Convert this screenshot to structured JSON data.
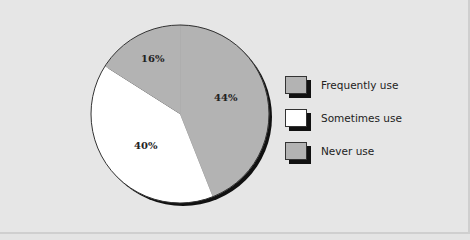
{
  "chart_data": {
    "type": "pie",
    "title": "",
    "slices": [
      {
        "label": "Frequently use",
        "value": 44,
        "display": "44%",
        "color": "#b3b3b3"
      },
      {
        "label": "Sometimes use",
        "value": 40,
        "display": "40%",
        "color": "#ffffff"
      },
      {
        "label": "Never use",
        "value": 16,
        "display": "16%",
        "color": "#b3b3b3"
      }
    ],
    "start_angle": "12 o'clock",
    "direction": "clockwise",
    "legend_position": "right"
  },
  "labels": {
    "slice0": "44%",
    "slice1": "40%",
    "slice2": "16%"
  },
  "legend": [
    {
      "label": "Frequently use",
      "color": "#b3b3b3"
    },
    {
      "label": "Sometimes use",
      "color": "#ffffff"
    },
    {
      "label": "Never use",
      "color": "#b3b3b3"
    }
  ]
}
